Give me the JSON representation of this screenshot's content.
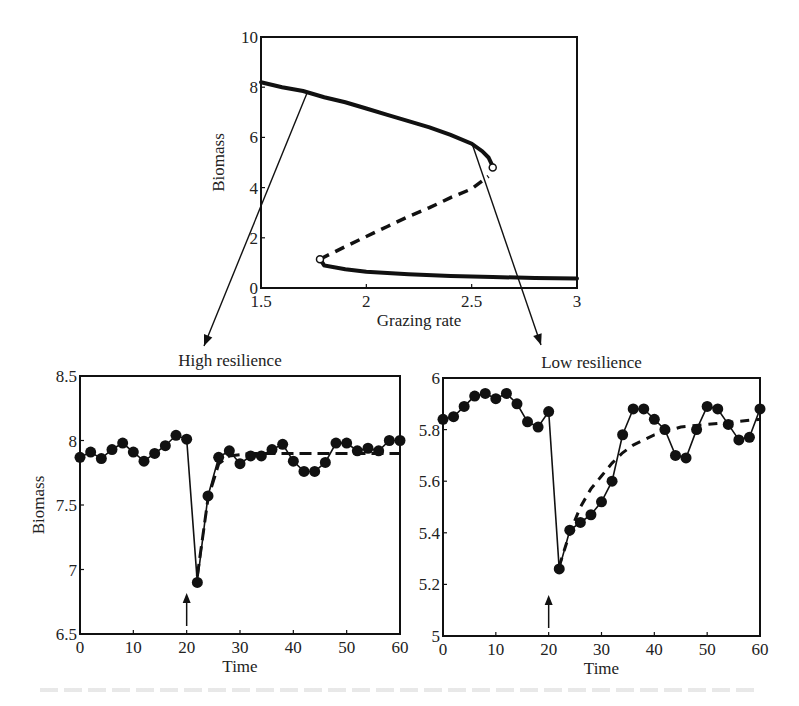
{
  "chart_data": [
    {
      "id": "bifurcation",
      "type": "line",
      "title": "",
      "xlabel": "Grazing rate",
      "ylabel": "Biomass",
      "xlim": [
        1.5,
        3
      ],
      "ylim": [
        0,
        10
      ],
      "xticks": [
        1.5,
        2,
        2.5,
        3
      ],
      "xtick_labels": [
        "1.5",
        "2",
        "2.5",
        "3"
      ],
      "yticks": [
        0,
        2,
        4,
        6,
        8,
        10
      ],
      "ytick_labels": [
        "0",
        "2",
        "4",
        "6",
        "8",
        "10"
      ],
      "grid": false,
      "series": [
        {
          "name": "Upper stable branch",
          "style": "solid",
          "x": [
            1.5,
            1.6,
            1.7,
            1.8,
            1.9,
            2.0,
            2.1,
            2.2,
            2.3,
            2.4,
            2.5,
            2.55,
            2.58,
            2.6
          ],
          "y": [
            8.2,
            8.0,
            7.85,
            7.6,
            7.4,
            7.15,
            6.9,
            6.65,
            6.4,
            6.1,
            5.75,
            5.45,
            5.2,
            4.85
          ]
        },
        {
          "name": "Unstable branch",
          "style": "dashed",
          "x": [
            1.78,
            1.9,
            2.0,
            2.1,
            2.2,
            2.3,
            2.4,
            2.5,
            2.58
          ],
          "y": [
            1.15,
            1.65,
            2.05,
            2.45,
            2.85,
            3.2,
            3.6,
            3.95,
            4.45
          ]
        },
        {
          "name": "Lower stable branch",
          "style": "solid",
          "x": [
            1.78,
            1.8,
            1.9,
            2.0,
            2.2,
            2.4,
            2.6,
            2.8,
            3.0
          ],
          "y": [
            1.15,
            0.9,
            0.75,
            0.65,
            0.55,
            0.48,
            0.44,
            0.4,
            0.38
          ]
        }
      ],
      "tipping_points": [
        {
          "label": "fold-upper",
          "x": 2.6,
          "y": 4.8
        },
        {
          "label": "fold-lower",
          "x": 1.78,
          "y": 1.15
        }
      ],
      "annotations": [
        {
          "text": "arrow to High resilience",
          "from": [
            1.72,
            7.8
          ]
        },
        {
          "text": "arrow to Low resilience",
          "from": [
            2.5,
            5.8
          ]
        }
      ]
    },
    {
      "id": "high-resilience",
      "type": "line",
      "title": "High resilience",
      "xlabel": "Time",
      "ylabel": "Biomass",
      "xlim": [
        0,
        60
      ],
      "ylim": [
        6.5,
        8.5
      ],
      "xticks": [
        0,
        10,
        20,
        30,
        40,
        50,
        60
      ],
      "xtick_labels": [
        "0",
        "10",
        "20",
        "30",
        "40",
        "50",
        "60"
      ],
      "yticks": [
        6.5,
        7,
        7.5,
        8,
        8.5
      ],
      "ytick_labels": [
        "6.5",
        "7",
        "7.5",
        "8",
        "8.5"
      ],
      "grid": false,
      "series": [
        {
          "name": "Simulated biomass",
          "style": "solid-markers",
          "x": [
            0,
            2,
            4,
            6,
            8,
            10,
            12,
            14,
            16,
            18,
            20,
            22,
            24,
            26,
            28,
            30,
            32,
            34,
            36,
            38,
            40,
            42,
            44,
            46,
            48,
            50,
            52,
            54,
            56,
            58,
            60
          ],
          "y": [
            7.87,
            7.91,
            7.86,
            7.93,
            7.98,
            7.91,
            7.84,
            7.9,
            7.96,
            8.04,
            8.01,
            6.9,
            7.57,
            7.87,
            7.92,
            7.82,
            7.88,
            7.88,
            7.93,
            7.97,
            7.84,
            7.76,
            7.76,
            7.83,
            7.98,
            7.98,
            7.92,
            7.94,
            7.92,
            8.0,
            8.0
          ]
        },
        {
          "name": "Deterministic recovery",
          "style": "dashed",
          "x": [
            22,
            24,
            26,
            28,
            32,
            40,
            50,
            60
          ],
          "y": [
            6.95,
            7.55,
            7.82,
            7.88,
            7.9,
            7.9,
            7.9,
            7.9
          ]
        }
      ],
      "annotations": [
        {
          "text": "perturbation arrow",
          "x": 20
        }
      ]
    },
    {
      "id": "low-resilience",
      "type": "line",
      "title": "Low resilience",
      "xlabel": "Time",
      "ylabel": "",
      "xlim": [
        0,
        60
      ],
      "ylim": [
        5,
        6
      ],
      "xticks": [
        0,
        10,
        20,
        30,
        40,
        50,
        60
      ],
      "xtick_labels": [
        "0",
        "10",
        "20",
        "30",
        "40",
        "50",
        "60"
      ],
      "yticks": [
        5,
        5.2,
        5.4,
        5.6,
        5.8,
        6
      ],
      "ytick_labels": [
        "5",
        "5.2",
        "5.4",
        "5.6",
        "5.8",
        "6"
      ],
      "grid": false,
      "series": [
        {
          "name": "Simulated biomass",
          "style": "solid-markers",
          "x": [
            0,
            2,
            4,
            6,
            8,
            10,
            12,
            14,
            16,
            18,
            20,
            22,
            24,
            26,
            28,
            30,
            32,
            34,
            36,
            38,
            40,
            42,
            44,
            46,
            48,
            50,
            52,
            54,
            56,
            58,
            60
          ],
          "y": [
            5.84,
            5.85,
            5.89,
            5.93,
            5.94,
            5.92,
            5.94,
            5.9,
            5.83,
            5.81,
            5.87,
            5.26,
            5.41,
            5.44,
            5.47,
            5.52,
            5.6,
            5.78,
            5.88,
            5.88,
            5.84,
            5.8,
            5.7,
            5.69,
            5.8,
            5.89,
            5.88,
            5.82,
            5.76,
            5.77,
            5.88
          ]
        },
        {
          "name": "Deterministic recovery",
          "style": "dashed",
          "x": [
            22,
            24,
            26,
            28,
            30,
            32,
            34,
            36,
            40,
            45,
            50,
            55,
            60
          ],
          "y": [
            5.27,
            5.4,
            5.5,
            5.57,
            5.62,
            5.67,
            5.71,
            5.74,
            5.78,
            5.81,
            5.82,
            5.83,
            5.84
          ]
        }
      ],
      "annotations": [
        {
          "text": "perturbation arrow",
          "x": 20
        }
      ]
    }
  ]
}
